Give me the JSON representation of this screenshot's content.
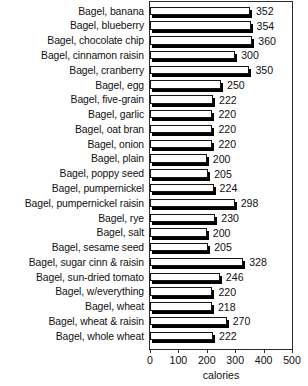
{
  "chart_data": {
    "type": "bar",
    "orientation": "horizontal",
    "title": "",
    "xlabel": "calories",
    "ylabel": "",
    "xlim": [
      0,
      500
    ],
    "xticks": [
      0,
      100,
      200,
      300,
      400,
      500
    ],
    "grid": false,
    "legend": false,
    "categories": [
      "Bagel, banana",
      "Bagel, blueberry",
      "Bagel, chocolate chip",
      "Bagel, cinnamon raisin",
      "Bagel, cranberry",
      "Bagel, egg",
      "Bagel, five-grain",
      "Bagel, garlic",
      "Bagel, oat bran",
      "Bagel, onion",
      "Bagel, plain",
      "Bagel, poppy seed",
      "Bagel, pumpernickel",
      "Bagel, pumpernickel raisin",
      "Bagel, rye",
      "Bagel, salt",
      "Bagel, sesame seed",
      "Bagel, sugar cinn & raisin",
      "Bagel, sun-dried tomato",
      "Bagel, w/everything",
      "Bagel, wheat",
      "Bagel, wheat & raisin",
      "Bagel, whole wheat"
    ],
    "values": [
      352,
      354,
      360,
      300,
      350,
      250,
      222,
      220,
      220,
      220,
      200,
      205,
      224,
      298,
      230,
      200,
      205,
      328,
      246,
      220,
      218,
      270,
      222
    ],
    "value_labels": [
      "352",
      "354",
      "360",
      "300",
      "350",
      "250",
      "222",
      "220",
      "220",
      "220",
      "200",
      "205",
      "224",
      "298",
      "230",
      "200",
      "205",
      "328",
      "246",
      "220",
      "218",
      "270",
      "222"
    ],
    "colors": {
      "bar_face": "#ffffff",
      "bar_outline": "#151515",
      "bar_shadow": "#000000",
      "frame": "#2b2b2b",
      "text": "#111111",
      "background": "#ffffff"
    }
  }
}
